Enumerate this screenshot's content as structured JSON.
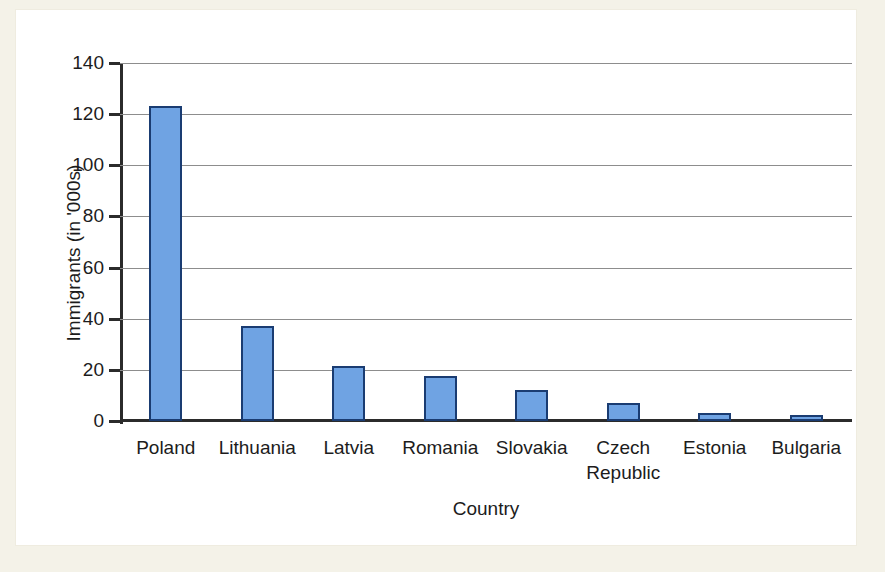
{
  "chart_data": {
    "type": "bar",
    "title": "",
    "xlabel": "Country",
    "ylabel": "Immigrants (in '000s)",
    "categories": [
      "Poland",
      "Lithuania",
      "Latvia",
      "Romania",
      "Slovakia",
      "Czech Republic",
      "Estonia",
      "Bulgaria"
    ],
    "values": [
      123,
      37,
      21.5,
      17.5,
      12,
      7,
      3,
      2.5
    ],
    "ylim": [
      0,
      140
    ],
    "yticks": [
      0,
      20,
      40,
      60,
      80,
      100,
      120,
      140
    ],
    "ytick_labels": [
      "0",
      "20",
      "40",
      "60",
      "80",
      "100",
      "120",
      "140"
    ],
    "grid": true,
    "legend": "none",
    "bar_color": "#6fa3e3",
    "bar_border_color": "#1a3c72",
    "gridline_color": "#8d8d8d",
    "axis_color": "#2b2b2b",
    "plot_background": "#ffffff",
    "page_background": "#f4f2e8"
  }
}
